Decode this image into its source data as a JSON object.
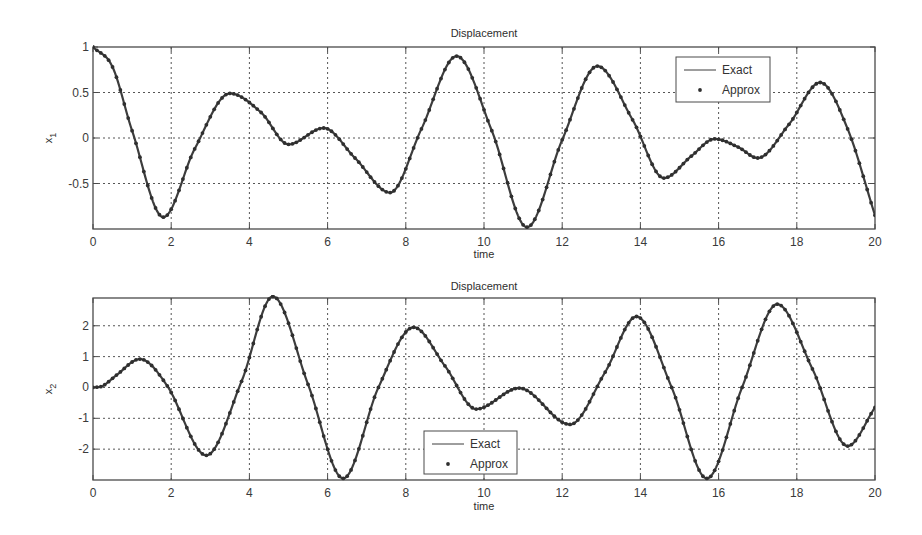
{
  "chart_data": [
    {
      "type": "line",
      "title": "Displacement",
      "xlabel": "time",
      "ylabel": "x1",
      "ylabel_main": "x",
      "ylabel_sub": "1",
      "xlim": [
        0,
        20
      ],
      "ylim": [
        -1,
        1
      ],
      "xticks": [
        0,
        2,
        4,
        6,
        8,
        10,
        12,
        14,
        16,
        18,
        20
      ],
      "xtick_labels": [
        "0",
        "2",
        "4",
        "6",
        "8",
        "10",
        "12",
        "14",
        "16",
        "18",
        "20"
      ],
      "yticks": [
        -0.5,
        0,
        0.5,
        1
      ],
      "ytick_labels": [
        "-0.5",
        "0",
        "0.5",
        "1"
      ],
      "grid": true,
      "legend": {
        "position": "upper-right",
        "entries": [
          "Exact",
          "Approx"
        ]
      },
      "series": [
        {
          "name": "Exact",
          "style": "solid-line",
          "x": [
            0,
            0.5,
            1.0,
            1.8,
            2.6,
            3.5,
            4.3,
            5.0,
            5.9,
            6.7,
            7.6,
            8.4,
            9.3,
            10.2,
            11.1,
            12.0,
            12.9,
            13.8,
            14.6,
            15.3,
            15.9,
            16.5,
            17.0,
            17.8,
            18.6,
            19.3,
            20.0
          ],
          "y": [
            1.0,
            0.78,
            0.08,
            -0.87,
            -0.12,
            0.49,
            0.28,
            -0.07,
            0.11,
            -0.22,
            -0.6,
            0.1,
            0.9,
            0.08,
            -0.98,
            -0.02,
            0.79,
            0.2,
            -0.44,
            -0.2,
            -0.01,
            -0.1,
            -0.22,
            0.15,
            0.61,
            0.1,
            -0.85
          ]
        },
        {
          "name": "Approx",
          "style": "dot-markers",
          "x": [
            0,
            0.5,
            1.0,
            1.8,
            2.6,
            3.5,
            4.3,
            5.0,
            5.9,
            6.7,
            7.6,
            8.4,
            9.3,
            10.2,
            11.1,
            12.0,
            12.9,
            13.8,
            14.6,
            15.3,
            15.9,
            16.5,
            17.0,
            17.8,
            18.6,
            19.3,
            20.0
          ],
          "y": [
            1.0,
            0.78,
            0.08,
            -0.87,
            -0.12,
            0.49,
            0.28,
            -0.07,
            0.11,
            -0.22,
            -0.6,
            0.1,
            0.9,
            0.08,
            -0.98,
            -0.02,
            0.79,
            0.2,
            -0.44,
            -0.2,
            -0.01,
            -0.1,
            -0.22,
            0.15,
            0.61,
            0.1,
            -0.85
          ]
        }
      ]
    },
    {
      "type": "line",
      "title": "Displacement",
      "xlabel": "time",
      "ylabel": "x2",
      "ylabel_main": "x",
      "ylabel_sub": "2",
      "xlim": [
        0,
        20
      ],
      "ylim": [
        -3,
        2.9
      ],
      "xticks": [
        0,
        2,
        4,
        6,
        8,
        10,
        12,
        14,
        16,
        18,
        20
      ],
      "xtick_labels": [
        "0",
        "2",
        "4",
        "6",
        "8",
        "10",
        "12",
        "14",
        "16",
        "18",
        "20"
      ],
      "yticks": [
        -2,
        -1,
        0,
        1,
        2
      ],
      "ytick_labels": [
        "-2",
        "-1",
        "0",
        "1",
        "2"
      ],
      "grid": true,
      "legend": {
        "position": "lower-center",
        "entries": [
          "Exact",
          "Approx"
        ]
      },
      "series": [
        {
          "name": "Exact",
          "style": "solid-line",
          "x": [
            0,
            0.25,
            0.6,
            1.2,
            1.9,
            2.9,
            3.8,
            4.6,
            5.5,
            6.4,
            7.3,
            8.2,
            9.0,
            9.8,
            10.9,
            12.2,
            13.1,
            13.9,
            14.8,
            15.7,
            16.6,
            17.5,
            18.4,
            19.3,
            20.0
          ],
          "y": [
            0.0,
            0.05,
            0.4,
            0.92,
            0.05,
            -2.2,
            0.2,
            2.95,
            0.1,
            -2.95,
            0.0,
            1.95,
            0.7,
            -0.7,
            -0.02,
            -1.2,
            0.5,
            2.3,
            0.0,
            -2.95,
            0.0,
            2.7,
            0.6,
            -1.9,
            -0.65
          ]
        },
        {
          "name": "Approx",
          "style": "dot-markers",
          "x": [
            0,
            0.25,
            0.6,
            1.2,
            1.9,
            2.9,
            3.8,
            4.6,
            5.5,
            6.4,
            7.3,
            8.2,
            9.0,
            9.8,
            10.9,
            12.2,
            13.1,
            13.9,
            14.8,
            15.7,
            16.6,
            17.5,
            18.4,
            19.3,
            20.0
          ],
          "y": [
            0.0,
            0.05,
            0.4,
            0.92,
            0.05,
            -2.2,
            0.2,
            2.95,
            0.1,
            -2.95,
            0.0,
            1.95,
            0.7,
            -0.7,
            -0.02,
            -1.2,
            0.5,
            2.3,
            0.0,
            -2.95,
            0.0,
            2.7,
            0.6,
            -1.9,
            -0.65
          ]
        }
      ]
    }
  ],
  "layout": {
    "plots": [
      {
        "left": 93,
        "right": 875,
        "top": 47,
        "bottom": 229,
        "title_y": 37,
        "xlabel_y": 258,
        "xtick_y": 246,
        "legend": {
          "x": 676,
          "y": 57,
          "w": 94,
          "h": 45
        }
      },
      {
        "left": 93,
        "right": 875,
        "top": 298,
        "bottom": 480,
        "title_y": 290,
        "xlabel_y": 510,
        "xtick_y": 497,
        "legend": {
          "x": 424,
          "y": 431,
          "w": 93,
          "h": 43
        }
      }
    ]
  },
  "colors": {
    "line": "#3d3d3d",
    "marker": "#2f2f2f",
    "axis": "#4a4a4a",
    "grid": "#555555",
    "background": "#ffffff"
  }
}
